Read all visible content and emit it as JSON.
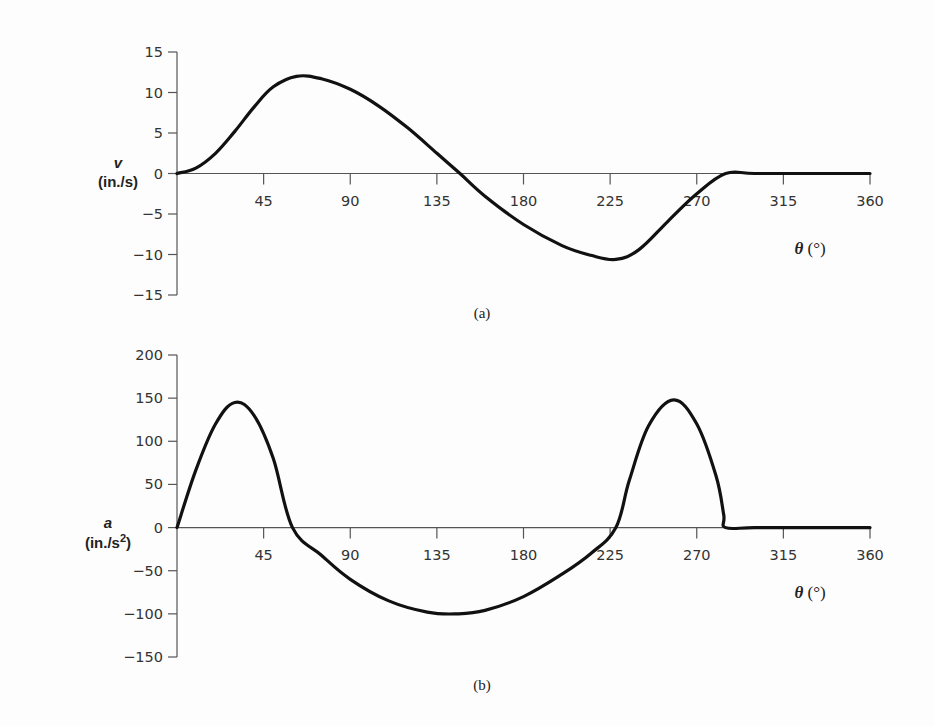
{
  "chart_data": [
    {
      "type": "line",
      "panel": "(a)",
      "title": "",
      "xlabel": "θ (°)",
      "ylabel": "v (in./s)",
      "xlim": [
        0,
        360
      ],
      "ylim": [
        -15,
        15
      ],
      "xticks": [
        45,
        90,
        135,
        180,
        225,
        270,
        315,
        360
      ],
      "yticks": [
        15,
        10,
        5,
        0,
        -5,
        -10,
        -15
      ],
      "grid": false,
      "legend": null,
      "series": [
        {
          "name": "v",
          "x": [
            0,
            10,
            20,
            30,
            40,
            50,
            62,
            75,
            90,
            105,
            120,
            135,
            147,
            160,
            180,
            200,
            215,
            228,
            240,
            255,
            270,
            285,
            300,
            330,
            360
          ],
          "values": [
            0,
            0.7,
            2.5,
            5.2,
            8.2,
            10.7,
            12.0,
            11.7,
            10.4,
            8.3,
            5.6,
            2.5,
            0,
            -2.8,
            -6.3,
            -8.9,
            -10.1,
            -10.6,
            -9.4,
            -5.9,
            -2.5,
            0,
            0,
            0,
            0
          ]
        }
      ]
    },
    {
      "type": "line",
      "panel": "(b)",
      "title": "",
      "xlabel": "θ (°)",
      "ylabel": "a (in./s²)",
      "xlim": [
        0,
        360
      ],
      "ylim": [
        -150,
        200
      ],
      "xticks": [
        45,
        90,
        135,
        180,
        225,
        270,
        315,
        360
      ],
      "yticks": [
        200,
        150,
        100,
        50,
        0,
        -50,
        -100,
        -150
      ],
      "grid": false,
      "legend": null,
      "series": [
        {
          "name": "a",
          "x": [
            0,
            10,
            20,
            30,
            40,
            50,
            60,
            75,
            90,
            110,
            130,
            145,
            160,
            180,
            200,
            215,
            228,
            235,
            245,
            258,
            270,
            280,
            284,
            285,
            300,
            330,
            360
          ],
          "values": [
            0,
            68,
            120,
            145,
            130,
            80,
            0,
            -32,
            -60,
            -85,
            -98,
            -100,
            -96,
            -80,
            -54,
            -30,
            0,
            55,
            118,
            148,
            120,
            60,
            15,
            0,
            0,
            0,
            0
          ]
        }
      ]
    }
  ],
  "panels": {
    "a": {
      "caption": "(a)",
      "ylabel_var": "v",
      "ylabel_unit": "(in./s)",
      "xlabel": "θ (°)",
      "yticks": [
        "15",
        "10",
        "5",
        "0",
        "−5",
        "−10",
        "−15"
      ],
      "xticks": [
        "45",
        "90",
        "135",
        "180",
        "225",
        "270",
        "315",
        "360"
      ]
    },
    "b": {
      "caption": "(b)",
      "ylabel_var": "a",
      "ylabel_unit_pre": "(in./s",
      "ylabel_unit_sup": "2",
      "ylabel_unit_post": ")",
      "xlabel": "θ (°)",
      "yticks": [
        "200",
        "150",
        "100",
        "50",
        "0",
        "−50",
        "−100",
        "−150"
      ],
      "xticks": [
        "45",
        "90",
        "135",
        "180",
        "225",
        "270",
        "315",
        "360"
      ]
    }
  },
  "colors": {
    "curve": "#111111",
    "axis": "#555555",
    "background": "#fdfdfd"
  }
}
